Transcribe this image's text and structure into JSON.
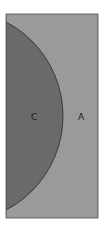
{
  "diagram": {
    "type": "venn",
    "colors": {
      "background": "#ffffff",
      "region_a": "#9a9a9a",
      "region_c": "#6a6a6a",
      "border": "#3a3a3a"
    },
    "regions": [
      {
        "id": "A",
        "label": "A"
      },
      {
        "id": "C",
        "label": "C"
      }
    ]
  }
}
